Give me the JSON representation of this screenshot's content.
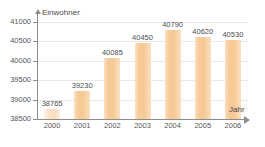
{
  "chart_data": {
    "type": "bar",
    "title": "",
    "xlabel": "Jahr",
    "ylabel": "Einwohner",
    "categories": [
      "2000",
      "2001",
      "2002",
      "2003",
      "2004",
      "2005",
      "2006"
    ],
    "values": [
      38765,
      39230,
      40085,
      40450,
      40790,
      40620,
      40530
    ],
    "value_labels": [
      "38765",
      "39230",
      "40085",
      "40450",
      "40790",
      "40620",
      "40530"
    ],
    "ylim": [
      38500,
      41000
    ],
    "ytick_labels": [
      "38500",
      "39000",
      "39500",
      "40000",
      "40500",
      "41000"
    ],
    "ytick_values": [
      38500,
      39000,
      39500,
      40000,
      40500,
      41000
    ],
    "grid": true,
    "legend": "none",
    "bar_color": "#F7CB9C",
    "axis_color": "#8D8D8D",
    "gridline_color": "#E8E8E8",
    "background_color": "#FFFFFF"
  }
}
